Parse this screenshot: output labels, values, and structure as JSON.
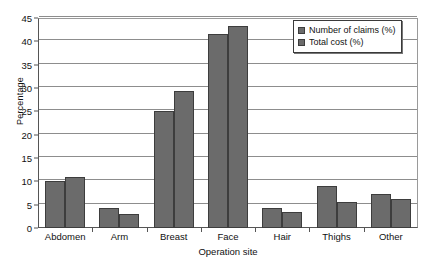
{
  "chart_data": {
    "type": "bar",
    "title": "",
    "xlabel": "Operation site",
    "ylabel": "Percentage",
    "categories": [
      "Abdomen",
      "Arm",
      "Breast",
      "Face",
      "Hair",
      "Thighs",
      "Other"
    ],
    "series": [
      {
        "name": "Number of claims (%)",
        "color": "#6b6b6b",
        "values": [
          10.0,
          4.2,
          25.1,
          41.5,
          4.2,
          9.1,
          7.3
        ]
      },
      {
        "name": "Total cost (%)",
        "color": "#6b6b6b",
        "values": [
          11.0,
          3.1,
          29.3,
          43.2,
          3.5,
          5.6,
          6.3
        ]
      }
    ],
    "ylim": [
      0,
      45
    ],
    "ytick_step": 5,
    "yticks": [
      0,
      5,
      10,
      15,
      20,
      25,
      30,
      35,
      40,
      45
    ],
    "grid": true,
    "legend_position": "top-right"
  }
}
